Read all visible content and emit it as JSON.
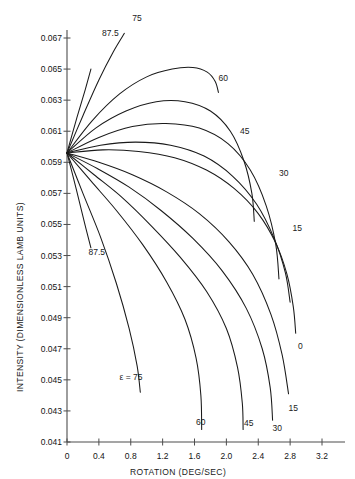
{
  "chart_data": {
    "type": "line",
    "title": "",
    "xlabel": "ROTATION (DEG/SEC)",
    "ylabel": "INTENSITY (DIMENSIONLESS LAMB UNITS)",
    "xlim": [
      0.0,
      3.3
    ],
    "ylim": [
      0.041,
      0.0675
    ],
    "xticks": [
      0,
      0.4,
      0.8,
      1.2,
      1.6,
      2.0,
      2.4,
      2.8,
      3.2
    ],
    "xtick_labels": [
      "0",
      "0.4",
      "0.8",
      "1.2",
      "1.6",
      "2.0",
      "2.4",
      "2.8",
      "3.2"
    ],
    "yticks": [
      0.041,
      0.043,
      0.045,
      0.047,
      0.049,
      0.051,
      0.053,
      0.055,
      0.057,
      0.059,
      0.061,
      0.063,
      0.065,
      0.067
    ],
    "ytick_labels": [
      "0.041",
      "0.043",
      "0.045",
      "0.047",
      "0.049",
      "0.051",
      "0.053",
      "0.055",
      "0.057",
      "0.059",
      "0.061",
      "0.063",
      "0.065",
      "0.067"
    ],
    "grid": false,
    "legend": "inline-curve-labels",
    "origin": [
      0.0,
      0.0596
    ],
    "parameter_symbol": "ε",
    "parameter_name": "epsilon",
    "parameter_units": "deg",
    "series": [
      {
        "name": "0",
        "label": "0",
        "epsilon": 0,
        "label_xy": [
          2.9,
          0.0472
        ],
        "points": [
          [
            0.0,
            0.0596
          ],
          [
            0.45,
            0.0598
          ],
          [
            0.9,
            0.0597
          ],
          [
            1.35,
            0.0593
          ],
          [
            1.75,
            0.0585
          ],
          [
            2.1,
            0.0573
          ],
          [
            2.4,
            0.0557
          ],
          [
            2.62,
            0.0538
          ],
          [
            2.76,
            0.0518
          ],
          [
            2.84,
            0.0497
          ],
          [
            2.87,
            0.048
          ]
        ]
      },
      {
        "name": "15",
        "label": "15",
        "epsilon": 15,
        "label_xy": [
          2.83,
          0.0548
        ],
        "points": [
          [
            0.0,
            0.0596
          ],
          [
            0.42,
            0.0601
          ],
          [
            0.86,
            0.0603
          ],
          [
            1.3,
            0.0601
          ],
          [
            1.72,
            0.0594
          ],
          [
            2.08,
            0.0581
          ],
          [
            2.38,
            0.0563
          ],
          [
            2.6,
            0.0541
          ],
          [
            2.74,
            0.0519
          ],
          [
            2.8,
            0.05
          ]
        ]
      },
      {
        "name": "15",
        "label": "15",
        "epsilon": 15,
        "label_xy": [
          2.78,
          0.0432
        ],
        "points": [
          [
            0.0,
            0.0596
          ],
          [
            0.4,
            0.059
          ],
          [
            0.82,
            0.0582
          ],
          [
            1.25,
            0.0571
          ],
          [
            1.66,
            0.0557
          ],
          [
            2.03,
            0.0539
          ],
          [
            2.33,
            0.0518
          ],
          [
            2.56,
            0.0492
          ],
          [
            2.7,
            0.0466
          ],
          [
            2.78,
            0.0441
          ]
        ]
      },
      {
        "name": "30",
        "label": "30",
        "epsilon": 30,
        "label_xy": [
          2.66,
          0.0583
        ],
        "points": [
          [
            0.0,
            0.0596
          ],
          [
            0.4,
            0.0606
          ],
          [
            0.82,
            0.0613
          ],
          [
            1.24,
            0.0615
          ],
          [
            1.66,
            0.0612
          ],
          [
            2.02,
            0.0602
          ],
          [
            2.3,
            0.0585
          ],
          [
            2.5,
            0.0562
          ],
          [
            2.62,
            0.0537
          ],
          [
            2.66,
            0.0515
          ]
        ]
      },
      {
        "name": "30",
        "label": "30",
        "epsilon": 30,
        "label_xy": [
          2.58,
          0.0419
        ],
        "points": [
          [
            0.0,
            0.0596
          ],
          [
            0.38,
            0.0586
          ],
          [
            0.78,
            0.0574
          ],
          [
            1.18,
            0.0559
          ],
          [
            1.58,
            0.0541
          ],
          [
            1.95,
            0.052
          ],
          [
            2.25,
            0.0496
          ],
          [
            2.45,
            0.047
          ],
          [
            2.55,
            0.0445
          ],
          [
            2.58,
            0.0424
          ]
        ]
      },
      {
        "name": "45",
        "label": "45",
        "epsilon": 45,
        "label_xy": [
          2.17,
          0.061
        ],
        "points": [
          [
            0.0,
            0.0596
          ],
          [
            0.36,
            0.0612
          ],
          [
            0.74,
            0.0623
          ],
          [
            1.12,
            0.0629
          ],
          [
            1.48,
            0.0629
          ],
          [
            1.8,
            0.0623
          ],
          [
            2.05,
            0.061
          ],
          [
            2.22,
            0.0591
          ],
          [
            2.32,
            0.057
          ],
          [
            2.35,
            0.0552
          ]
        ]
      },
      {
        "name": "45",
        "label": "45",
        "epsilon": 45,
        "label_xy": [
          2.22,
          0.0422
        ],
        "points": [
          [
            0.0,
            0.0596
          ],
          [
            0.34,
            0.0582
          ],
          [
            0.7,
            0.0567
          ],
          [
            1.06,
            0.0549
          ],
          [
            1.42,
            0.0529
          ],
          [
            1.75,
            0.0507
          ],
          [
            2.0,
            0.0483
          ],
          [
            2.14,
            0.0458
          ],
          [
            2.2,
            0.0435
          ],
          [
            2.21,
            0.0418
          ]
        ]
      },
      {
        "name": "60",
        "label": "60",
        "epsilon": 60,
        "label_xy": [
          1.9,
          0.0644
        ],
        "points": [
          [
            0.0,
            0.0596
          ],
          [
            0.32,
            0.0617
          ],
          [
            0.66,
            0.0634
          ],
          [
            1.0,
            0.0645
          ],
          [
            1.32,
            0.065
          ],
          [
            1.58,
            0.0651
          ],
          [
            1.76,
            0.0648
          ],
          [
            1.86,
            0.0642
          ],
          [
            1.9,
            0.0635
          ]
        ]
      },
      {
        "name": "60",
        "label": "60",
        "epsilon": 60,
        "label_xy": [
          1.62,
          0.0423
        ],
        "points": [
          [
            0.0,
            0.0596
          ],
          [
            0.3,
            0.0578
          ],
          [
            0.62,
            0.0559
          ],
          [
            0.95,
            0.0537
          ],
          [
            1.25,
            0.0513
          ],
          [
            1.48,
            0.0489
          ],
          [
            1.62,
            0.0464
          ],
          [
            1.68,
            0.044
          ],
          [
            1.69,
            0.0418
          ]
        ]
      },
      {
        "name": "75",
        "label": "75",
        "epsilon": 75,
        "label_xy": [
          0.82,
          0.0683
        ],
        "points": [
          [
            0.0,
            0.0596
          ],
          [
            0.2,
            0.062
          ],
          [
            0.4,
            0.0643
          ],
          [
            0.58,
            0.0661
          ],
          [
            0.72,
            0.0673
          ]
        ]
      },
      {
        "name": "75",
        "label": "ε = 75",
        "epsilon": 75,
        "label_xy": [
          0.66,
          0.0452
        ],
        "points": [
          [
            0.0,
            0.0596
          ],
          [
            0.2,
            0.057
          ],
          [
            0.42,
            0.0542
          ],
          [
            0.62,
            0.0512
          ],
          [
            0.78,
            0.0483
          ],
          [
            0.88,
            0.0459
          ],
          [
            0.92,
            0.0442
          ]
        ]
      },
      {
        "name": "87.5",
        "label": "87.5",
        "epsilon": 87.5,
        "label_xy": [
          0.44,
          0.0673
        ],
        "points": [
          [
            0.0,
            0.0596
          ],
          [
            0.12,
            0.0618
          ],
          [
            0.23,
            0.0637
          ],
          [
            0.3,
            0.065
          ]
        ]
      },
      {
        "name": "87.5",
        "label": "87.5",
        "epsilon": 87.5,
        "label_xy": [
          0.27,
          0.0532
        ],
        "points": [
          [
            0.0,
            0.0596
          ],
          [
            0.12,
            0.0572
          ],
          [
            0.22,
            0.0551
          ],
          [
            0.3,
            0.0535
          ]
        ]
      }
    ]
  }
}
